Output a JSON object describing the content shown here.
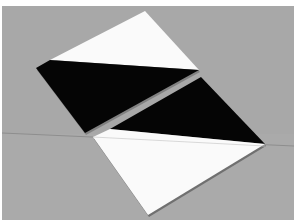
{
  "image": {
    "description": "Photograph of two square tiles on a grey surface, each split diagonally into black and white halves",
    "colors": {
      "background": "#a8a8a8",
      "tile_white": "#fafafa",
      "tile_black": "#050505",
      "seam": "#8e8e8e",
      "shadow": "#555555"
    },
    "objects": [
      {
        "name": "upper-tile",
        "halves": [
          "white",
          "black"
        ]
      },
      {
        "name": "lower-tile",
        "halves": [
          "black",
          "white"
        ]
      }
    ]
  }
}
